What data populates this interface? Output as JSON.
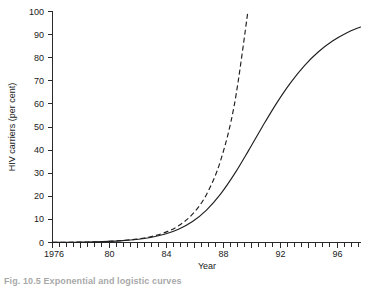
{
  "figure": {
    "caption": "Fig. 10.5    Exponential and logistic curves"
  },
  "axes": {
    "x": {
      "title": "Year",
      "tick_labels": [
        "1976",
        "80",
        "84",
        "88",
        "92",
        "96"
      ],
      "tick_values": [
        1976,
        1980,
        1984,
        1988,
        1992,
        1996
      ],
      "minor_step": 1,
      "range": [
        1976,
        1998
      ]
    },
    "y": {
      "title": "HIV carriers (per cent)",
      "tick_labels": [
        "0",
        "10",
        "20",
        "30",
        "40",
        "50",
        "60",
        "70",
        "80",
        "90",
        "100"
      ],
      "tick_values": [
        0,
        10,
        20,
        30,
        40,
        50,
        60,
        70,
        80,
        90,
        100
      ],
      "range": [
        0,
        100
      ]
    }
  },
  "chart_data": {
    "type": "line",
    "title": "",
    "xlabel": "Year",
    "ylabel": "HIV carriers (per cent)",
    "xlim": [
      1976,
      1998
    ],
    "ylim": [
      0,
      100
    ],
    "grid": false,
    "legend": "none",
    "x": [
      1976,
      1977,
      1978,
      1979,
      1980,
      1981,
      1982,
      1983,
      1984,
      1985,
      1986,
      1987,
      1988,
      1989,
      1990,
      1991,
      1992,
      1993,
      1994,
      1995,
      1996,
      1997,
      1998
    ],
    "series": [
      {
        "name": "Logistic curve",
        "style": "solid",
        "color": "#1f1f1f",
        "values": [
          0.06,
          0.1,
          0.17,
          0.28,
          0.47,
          0.79,
          1.31,
          2.16,
          3.54,
          5.73,
          9.08,
          14.04,
          20.93,
          29.69,
          39.77,
          50.25,
          60.25,
          69.13,
          76.59,
          82.56,
          87.2,
          90.7,
          93.3
        ]
      },
      {
        "name": "Exponential curve",
        "style": "dashed",
        "color": "#1f1f1f",
        "values": [
          0.06,
          0.1,
          0.18,
          0.3,
          0.51,
          0.87,
          1.48,
          2.51,
          4.26,
          7.23,
          12.27,
          20.82,
          35.34,
          59.97,
          101.8,
          null,
          null,
          null,
          null,
          null,
          null,
          null,
          null
        ]
      }
    ],
    "annotations": [
      "Solid line saturates near 99 per cent after 1994",
      "Dashed exponential exits the top of the plot near 1990"
    ]
  }
}
